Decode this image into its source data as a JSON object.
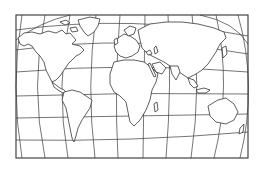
{
  "map": {
    "title": "World outline map",
    "projection": "rounded world projection in rectangular frame",
    "background_color": "#ffffff",
    "line_color": "#2a2a2a",
    "highlight": {
      "region": "Eastern United States / Great Lakes area",
      "color": "#cfcfcf"
    },
    "frame": {
      "x": 16,
      "y": 15,
      "width": 232,
      "height": 143
    },
    "continents": [
      "North America",
      "South America",
      "Europe",
      "Africa",
      "Asia",
      "Australia",
      "Greenland"
    ],
    "labels": []
  }
}
